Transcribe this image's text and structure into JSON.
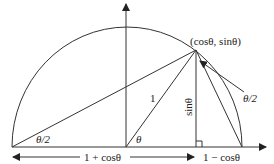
{
  "diagram": {
    "colors": {
      "stroke": "#333333",
      "text": "#222222",
      "background": "#ffffff"
    },
    "labels": {
      "point": "(cosθ, sinθ)",
      "half_angle_left": "θ/2",
      "half_angle_right": "θ/2",
      "angle_theta": "θ",
      "radius": "1",
      "height": "sinθ",
      "left_length": "1 + cosθ",
      "right_length": "1 − cosθ"
    },
    "elements": [
      "semicircle",
      "x-axis-arrow",
      "y-axis-arrow",
      "radius-to-point",
      "chord-from-left-end",
      "chord-to-right-end",
      "perpendicular-sinθ",
      "right-angle-marker",
      "dimension-arrow-1-plus-cos",
      "pointer-arrow-θ/2"
    ]
  }
}
